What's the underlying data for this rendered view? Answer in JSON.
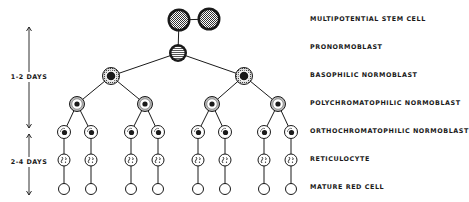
{
  "diagram": {
    "stages": [
      {
        "id": "stem",
        "label": "MULTIPOTENTIAL STEM CELL",
        "y": 19
      },
      {
        "id": "pro",
        "label": "PRONORMOBLAST",
        "y": 47
      },
      {
        "id": "baso",
        "label": "BASOPHILIC NORMOBLAST",
        "y": 75
      },
      {
        "id": "poly",
        "label": "POLYCHROMATOPHILIC NORMOBLAST",
        "y": 103
      },
      {
        "id": "ortho",
        "label": "ORTHOCHROMATOPHILIC NORMOBLAST",
        "y": 131
      },
      {
        "id": "retic",
        "label": "RETICULOCYTE",
        "y": 159
      },
      {
        "id": "mature",
        "label": "MATURE RED CELL",
        "y": 187
      }
    ],
    "durations": [
      {
        "label": "1-2 DAYS",
        "x": 29,
        "y_top": 27,
        "y_bottom": 128,
        "label_y": 77
      },
      {
        "label": "2-4 DAYS",
        "x": 29,
        "y_top": 134,
        "y_bottom": 195,
        "label_y": 162
      }
    ],
    "nodes": {
      "stem": [
        {
          "x": 179,
          "y": 20,
          "r": 11.5
        },
        {
          "x": 209,
          "y": 19,
          "r": 11.5
        }
      ],
      "pro": [
        {
          "x": 178,
          "y": 53,
          "r": 9
        }
      ],
      "baso": [
        {
          "x": 111,
          "y": 76,
          "r": 8.5
        },
        {
          "x": 244,
          "y": 76,
          "r": 8.5
        }
      ],
      "poly": [
        {
          "x": 77,
          "y": 104,
          "r": 7.5
        },
        {
          "x": 145,
          "y": 104,
          "r": 7.5
        },
        {
          "x": 212,
          "y": 104,
          "r": 7.5
        },
        {
          "x": 278,
          "y": 104,
          "r": 7.5
        }
      ],
      "ortho": [
        {
          "x": 64,
          "y": 132,
          "r": 6.5
        },
        {
          "x": 91,
          "y": 132,
          "r": 6.5
        },
        {
          "x": 131,
          "y": 132,
          "r": 6.5
        },
        {
          "x": 158,
          "y": 132,
          "r": 6.5
        },
        {
          "x": 198,
          "y": 132,
          "r": 6.5
        },
        {
          "x": 225,
          "y": 132,
          "r": 6.5
        },
        {
          "x": 264,
          "y": 132,
          "r": 6.5
        },
        {
          "x": 291,
          "y": 132,
          "r": 6.5
        }
      ],
      "retic": [
        {
          "x": 64,
          "y": 160,
          "r": 6
        },
        {
          "x": 91,
          "y": 160,
          "r": 6
        },
        {
          "x": 131,
          "y": 160,
          "r": 6
        },
        {
          "x": 158,
          "y": 160,
          "r": 6
        },
        {
          "x": 198,
          "y": 160,
          "r": 6
        },
        {
          "x": 225,
          "y": 160,
          "r": 6
        },
        {
          "x": 264,
          "y": 160,
          "r": 6
        },
        {
          "x": 291,
          "y": 160,
          "r": 6
        }
      ],
      "mature": [
        {
          "x": 64,
          "y": 189,
          "r": 5.5
        },
        {
          "x": 91,
          "y": 189,
          "r": 5.5
        },
        {
          "x": 131,
          "y": 189,
          "r": 5.5
        },
        {
          "x": 158,
          "y": 189,
          "r": 5.5
        },
        {
          "x": 198,
          "y": 189,
          "r": 5.5
        },
        {
          "x": 225,
          "y": 189,
          "r": 5.5
        },
        {
          "x": 264,
          "y": 189,
          "r": 5.5
        },
        {
          "x": 291,
          "y": 189,
          "r": 5.5
        }
      ]
    },
    "colors": {
      "ink": "#1a1a1a",
      "grey": "#b8b8b8",
      "paper": "#ffffff"
    }
  }
}
